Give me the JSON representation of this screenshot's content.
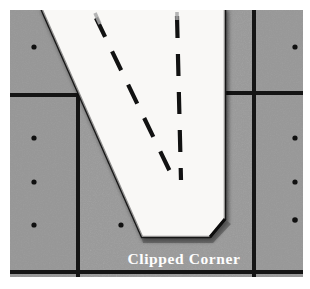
{
  "figure": {
    "kind": "photograph",
    "annotation_label": "Clipped Corner",
    "colors": {
      "page_background": "#ffffff",
      "surface_gray": "#9a9a9a",
      "surface_gray_dark": "#8f8f8f",
      "grid_line": "#141414",
      "part_white": "#f7f6f4",
      "part_edge_shadow": "#1a1a1a",
      "dot_marker": "#101010",
      "dashed_line": "#121212",
      "caption_color": "#ffffff"
    },
    "frame": {
      "left": 10,
      "top": 10,
      "right": 303,
      "bottom": 277
    },
    "grid": {
      "vertical_lines": [
        78,
        254
      ],
      "horizontal_lines": [
        95,
        272
      ],
      "line_width": 4
    },
    "markers": [
      {
        "x": 34,
        "y": 47
      },
      {
        "x": 34,
        "y": 138
      },
      {
        "x": 34,
        "y": 182
      },
      {
        "x": 34,
        "y": 225
      },
      {
        "x": 121,
        "y": 225
      },
      {
        "x": 295,
        "y": 47
      },
      {
        "x": 295,
        "y": 138
      },
      {
        "x": 295,
        "y": 182
      },
      {
        "x": 295,
        "y": 220
      }
    ],
    "part_outline": [
      {
        "x": 41,
        "y": 10
      },
      {
        "x": 142,
        "y": 237
      },
      {
        "x": 210,
        "y": 237
      },
      {
        "x": 225,
        "y": 219
      },
      {
        "x": 225,
        "y": 10
      }
    ],
    "clipped_corner_vertex": {
      "x": 210,
      "y": 237
    },
    "dashed_lines": [
      {
        "name": "left-scribe-line",
        "x1": 96,
        "y1": 18,
        "x2": 175,
        "y2": 182
      },
      {
        "name": "right-scribe-line",
        "x1": 177,
        "y1": 16,
        "x2": 181,
        "y2": 180
      }
    ],
    "caption": {
      "text": "Clipped Corner",
      "x": 184,
      "y": 264
    }
  }
}
